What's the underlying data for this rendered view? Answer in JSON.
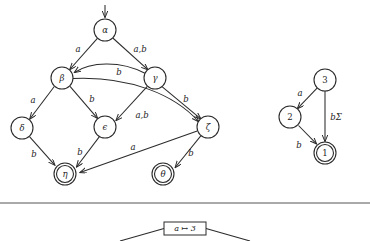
{
  "figure": {
    "title": "",
    "colors": {
      "ink": "#2b2b2b",
      "background": "#ffffff",
      "divider": "#555555"
    }
  },
  "automaton_left": {
    "name": "greek-state-automaton",
    "start_state": "alpha",
    "accepting_states": [
      "eta",
      "theta"
    ],
    "nodes": [
      {
        "id": "alpha",
        "label": "α",
        "x": 105,
        "y": 30,
        "r": 11,
        "accepting": false
      },
      {
        "id": "beta",
        "label": "β",
        "x": 62,
        "y": 78,
        "r": 11,
        "accepting": false
      },
      {
        "id": "gamma",
        "label": "γ",
        "x": 155,
        "y": 78,
        "r": 11,
        "accepting": false
      },
      {
        "id": "delta",
        "label": "δ",
        "x": 22,
        "y": 128,
        "r": 11,
        "accepting": false
      },
      {
        "id": "epsilon",
        "label": "ϵ",
        "x": 105,
        "y": 127,
        "r": 11,
        "accepting": false
      },
      {
        "id": "zeta",
        "label": "ζ",
        "x": 208,
        "y": 127,
        "r": 11,
        "accepting": false
      },
      {
        "id": "eta",
        "label": "η",
        "x": 65,
        "y": 174,
        "r": 11,
        "accepting": true
      },
      {
        "id": "theta",
        "label": "θ",
        "x": 163,
        "y": 174,
        "r": 11,
        "accepting": true
      }
    ],
    "edges": [
      {
        "from": "alpha",
        "to": "beta",
        "label": "a",
        "label_x": 78,
        "label_y": 49
      },
      {
        "from": "alpha",
        "to": "gamma",
        "label": "a,b",
        "label_x": 140,
        "label_y": 49
      },
      {
        "from": "gamma",
        "to": "beta",
        "label": "b",
        "label_x": 119,
        "label_y": 72
      },
      {
        "from": "beta",
        "to": "delta",
        "label": "a",
        "label_x": 33,
        "label_y": 100
      },
      {
        "from": "beta",
        "to": "epsilon",
        "label": "b",
        "label_x": 92,
        "label_y": 99
      },
      {
        "from": "gamma",
        "to": "epsilon",
        "label": "a,b",
        "label_x": 142,
        "label_y": 115
      },
      {
        "from": "gamma",
        "to": "zeta",
        "label": "b",
        "label_x": 186,
        "label_y": 99
      },
      {
        "from": "beta",
        "to": "zeta",
        "label": "",
        "label_x": 0,
        "label_y": 0
      },
      {
        "from": "delta",
        "to": "eta",
        "label": "b",
        "label_x": 34,
        "label_y": 154
      },
      {
        "from": "epsilon",
        "to": "eta",
        "label": "b",
        "label_x": 80,
        "label_y": 152
      },
      {
        "from": "zeta",
        "to": "eta",
        "label": "a",
        "label_x": 133,
        "label_y": 147
      },
      {
        "from": "zeta",
        "to": "theta",
        "label": "b",
        "label_x": 191,
        "label_y": 153
      }
    ]
  },
  "automaton_right": {
    "name": "numeric-state-automaton",
    "accepting_states": [
      "1"
    ],
    "nodes": [
      {
        "id": "3",
        "label": "3",
        "x": 325,
        "y": 80,
        "r": 11,
        "accepting": false
      },
      {
        "id": "2",
        "label": "2",
        "x": 290,
        "y": 117,
        "r": 11,
        "accepting": false
      },
      {
        "id": "1",
        "label": "1",
        "x": 325,
        "y": 153,
        "r": 11,
        "accepting": true
      }
    ],
    "edges": [
      {
        "from": "3",
        "to": "2",
        "label": "a",
        "label_x": 300,
        "label_y": 93
      },
      {
        "from": "3",
        "to": "1",
        "label": "bΣ",
        "label_x": 335,
        "label_y": 117
      },
      {
        "from": "2",
        "to": "1",
        "label": "b",
        "label_x": 299,
        "label_y": 145
      }
    ]
  },
  "divider": {
    "name": "section-divider",
    "y": 203
  },
  "tree_fragment": {
    "root_label": "a ↦ 3",
    "box": {
      "x": 164,
      "y": 222,
      "width": 42,
      "height": 13
    },
    "branches": [
      {
        "x1": 164,
        "y1": 228,
        "x2": 122,
        "y2": 241
      },
      {
        "x1": 206,
        "y1": 228,
        "x2": 248,
        "y2": 241
      }
    ]
  }
}
